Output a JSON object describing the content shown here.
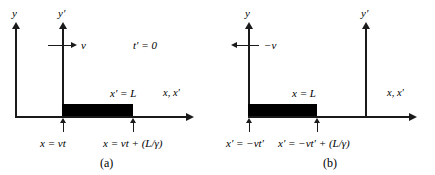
{
  "figure": {
    "panels": [
      {
        "id": "a",
        "caption": "(a)",
        "y_axis_label": "y",
        "y_prime_axis_label": "y′",
        "x_axis_label": "x, x′",
        "velocity_label": "v",
        "time_label": "t′ = 0",
        "rod_label": "x′ = L",
        "left_endpoint_label": "x = vt",
        "right_endpoint_label": "x = vt + (L/γ)"
      },
      {
        "id": "b",
        "caption": "(b)",
        "y_axis_label": "y",
        "y_prime_axis_label": "y′",
        "x_axis_label": "x, x′",
        "velocity_label": "−v",
        "rod_label": "x = L",
        "left_endpoint_label": "x′ = −vt′",
        "right_endpoint_label": "x′ = −vt′ + (L/γ)"
      }
    ],
    "colors": {
      "stroke": "#1a1a1a",
      "rod_fill": "#000000",
      "background": "#ffffff"
    }
  }
}
